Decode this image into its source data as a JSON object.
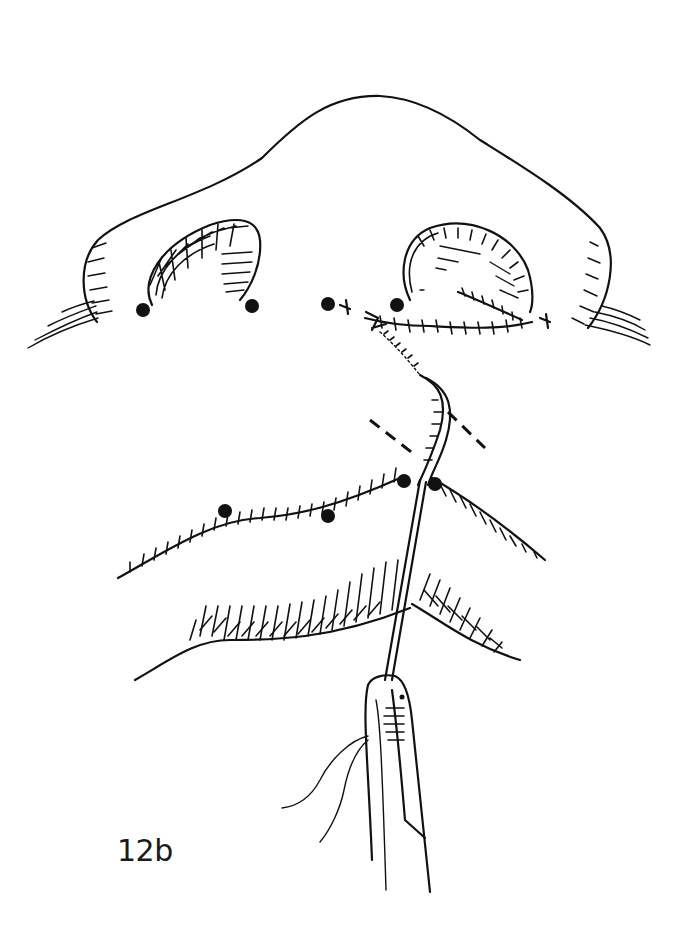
{
  "figure": {
    "label": "12b",
    "ink_color": "#111111",
    "background": "#ffffff"
  },
  "elements": {
    "landmark_dots_count": 8,
    "dashed_guides_count": 2,
    "instrument": "needle-holder",
    "suture_lines": [
      "nostril-sill-closure",
      "nasal-floor-closure",
      "columella-lip-incision"
    ]
  }
}
